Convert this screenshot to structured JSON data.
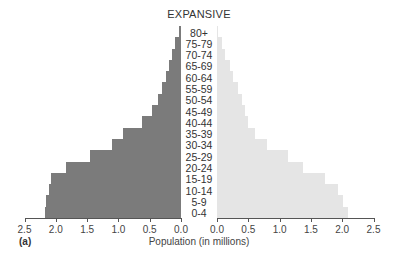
{
  "chart_data": {
    "type": "bar",
    "orientation": "horizontal",
    "subtype": "population-pyramid",
    "title": "EXPANSIVE",
    "panel_label": "(a)",
    "xlabel": "Population (in millions)",
    "ylabel": "",
    "categories": [
      "80+",
      "75-79",
      "70-74",
      "65-69",
      "60-64",
      "55-59",
      "50-54",
      "45-49",
      "40-44",
      "35-39",
      "30-34",
      "25-29",
      "20-24",
      "15-19",
      "10-14",
      "5-9",
      "0-4"
    ],
    "series": [
      {
        "name": "Left (dark)",
        "color": "#7b7b7b",
        "side": "left",
        "values": [
          0.03,
          0.1,
          0.14,
          0.19,
          0.24,
          0.3,
          0.37,
          0.46,
          0.62,
          0.93,
          1.1,
          1.46,
          1.83,
          2.07,
          2.11,
          2.15,
          2.18
        ]
      },
      {
        "name": "Right (light)",
        "color": "#e5e5e5",
        "side": "right",
        "values": [
          0.02,
          0.08,
          0.13,
          0.21,
          0.26,
          0.34,
          0.4,
          0.45,
          0.5,
          0.61,
          0.8,
          1.13,
          1.38,
          1.72,
          1.93,
          2.01,
          2.09
        ]
      }
    ],
    "xlim": [
      0,
      2.5
    ],
    "left_ticks": [
      "2.5",
      "2.0",
      "1.5",
      "1.0",
      "0.5",
      "0.0"
    ],
    "right_ticks": [
      "0.0",
      "0.5",
      "1.0",
      "1.5",
      "2.0",
      "2.5"
    ],
    "grid": false,
    "legend": null
  }
}
